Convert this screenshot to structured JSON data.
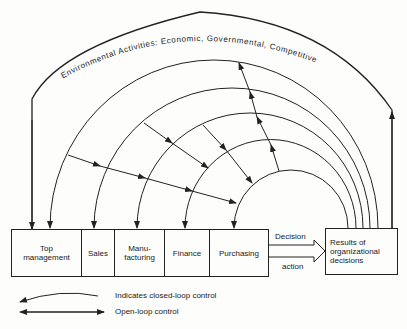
{
  "environment_label": "Environmental Activities: Economic, Governmental, Competitive",
  "departments": [
    {
      "label_1": "Top",
      "label_2": "management"
    },
    {
      "label_1": "Sales",
      "label_2": ""
    },
    {
      "label_1": "Manu-",
      "label_2": "facturing"
    },
    {
      "label_1": "Finance",
      "label_2": ""
    },
    {
      "label_1": "Purchasing",
      "label_2": ""
    }
  ],
  "arrow_top_label": "Decision",
  "arrow_bottom_label": "action",
  "results": {
    "line_1": "Results of",
    "line_2": "organizational",
    "line_3": "decisions"
  },
  "legend": {
    "closed_loop": "Indicates closed-loop control",
    "open_loop": "Open-loop control"
  }
}
